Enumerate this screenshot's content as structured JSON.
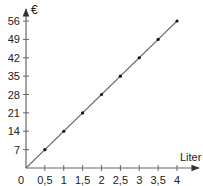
{
  "chart_data": {
    "type": "line",
    "title": "",
    "xlabel": "Liter",
    "ylabel": "€",
    "x": [
      0,
      0.5,
      1,
      1.5,
      2,
      2.5,
      3,
      3.5,
      4
    ],
    "series": [
      {
        "name": "Preis",
        "values": [
          0,
          7,
          14,
          21,
          28,
          35,
          42,
          49,
          56
        ]
      }
    ],
    "x_ticks": [
      0.5,
      1,
      1.5,
      2,
      2.5,
      3,
      3.5,
      4
    ],
    "x_tick_labels": [
      "0,5",
      "1",
      "1,5",
      "2",
      "2,5",
      "3",
      "3,5",
      "4"
    ],
    "y_ticks": [
      7,
      14,
      21,
      28,
      35,
      42,
      49,
      56
    ],
    "y_tick_labels": [
      "7",
      "14",
      "21",
      "28",
      "35",
      "42",
      "49",
      "56"
    ],
    "origin_label": "0",
    "xlim": [
      0,
      4.5
    ],
    "ylim": [
      0,
      60
    ],
    "grid": false,
    "legend": "none",
    "markers": "dots at each 0,5 liter step",
    "colors": {
      "axis": "#555555",
      "line": "#555555",
      "marker": "#111111",
      "text": "#222222"
    }
  }
}
